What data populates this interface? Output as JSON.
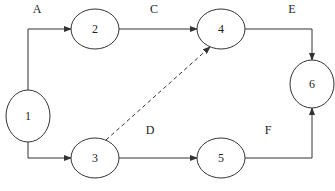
{
  "diagram": {
    "type": "activity-on-arrow network",
    "nodes": [
      {
        "id": "1",
        "label": "1"
      },
      {
        "id": "2",
        "label": "2"
      },
      {
        "id": "3",
        "label": "3"
      },
      {
        "id": "4",
        "label": "4"
      },
      {
        "id": "5",
        "label": "5"
      },
      {
        "id": "6",
        "label": "6"
      }
    ],
    "edges": [
      {
        "label": "A",
        "from": "1",
        "to": "2",
        "style": "solid"
      },
      {
        "label": "B",
        "from": "1",
        "to": "3",
        "style": "solid"
      },
      {
        "label": "C",
        "from": "2",
        "to": "4",
        "style": "solid"
      },
      {
        "label": "D",
        "from": "3",
        "to": "5",
        "style": "solid"
      },
      {
        "label": "E",
        "from": "4",
        "to": "6",
        "style": "solid"
      },
      {
        "label": "F",
        "from": "5",
        "to": "6",
        "style": "solid"
      },
      {
        "label": "",
        "from": "3",
        "to": "4",
        "style": "dashed"
      }
    ],
    "colors": {
      "stroke": "#333333",
      "background": "#ffffff",
      "text": "#222222"
    }
  }
}
